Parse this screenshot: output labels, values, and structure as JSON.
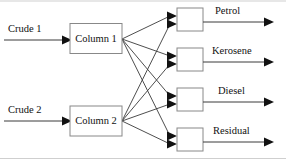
{
  "diagram": {
    "type": "process-flow",
    "colors": {
      "background": "#ffffff",
      "box_stroke": "#888888",
      "box_fill": "#ffffff",
      "line": "#3a3a3a",
      "arrow": "#111111",
      "text": "#111111",
      "frame": "#cfcfcf"
    },
    "inputs": [
      {
        "id": "crude-1",
        "label": "Crude 1",
        "target": "column-1"
      },
      {
        "id": "crude-2",
        "label": "Crude 2",
        "target": "column-2"
      }
    ],
    "processes": [
      {
        "id": "column-1",
        "label": "Column 1"
      },
      {
        "id": "column-2",
        "label": "Column 2"
      }
    ],
    "products": [
      {
        "id": "product-1",
        "label": "Petrol"
      },
      {
        "id": "product-2",
        "label": "Kerosene"
      },
      {
        "id": "product-3",
        "label": "Diesel"
      },
      {
        "id": "product-4",
        "label": "Residual"
      }
    ],
    "connections": [
      {
        "from": "crude-1",
        "to": "column-1"
      },
      {
        "from": "crude-2",
        "to": "column-2"
      },
      {
        "from": "column-1",
        "to": "product-1"
      },
      {
        "from": "column-1",
        "to": "product-2"
      },
      {
        "from": "column-1",
        "to": "product-3"
      },
      {
        "from": "column-1",
        "to": "product-4"
      },
      {
        "from": "column-2",
        "to": "product-1"
      },
      {
        "from": "column-2",
        "to": "product-2"
      },
      {
        "from": "column-2",
        "to": "product-3"
      },
      {
        "from": "column-2",
        "to": "product-4"
      }
    ]
  }
}
